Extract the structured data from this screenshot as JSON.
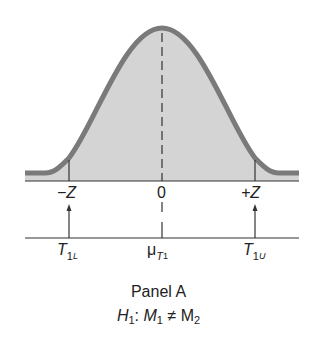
{
  "diagram": {
    "title": "Panel A",
    "hypothesis": {
      "prefix": "H",
      "prefix_sub": "1",
      "colon": ":",
      "lhs": "M",
      "lhs_sub": "1",
      "op": "≠",
      "rhs": "M",
      "rhs_sub": "2"
    },
    "z_axis": {
      "labels": [
        "−Z",
        "0",
        "+Z"
      ]
    },
    "t_axis": {
      "left": {
        "main": "T",
        "sub": "1",
        "subsub": "L"
      },
      "center": {
        "main": "μ",
        "sub": "T",
        "subsub": "1"
      },
      "right": {
        "main": "T",
        "sub": "1",
        "subsub": "U"
      }
    },
    "colors": {
      "curve": "#7a7a7a",
      "fill": "#d4d4d4",
      "axis": "#333333"
    }
  }
}
